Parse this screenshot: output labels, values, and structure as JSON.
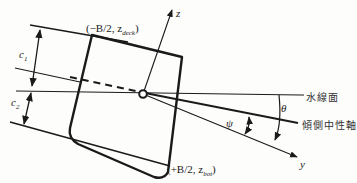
{
  "diagram": {
    "labels": {
      "deck_point": "(−B/2, z",
      "deck_sub": "deck",
      "deck_close": ")",
      "bot_point": "(+B/2, z",
      "bot_sub": "bot",
      "bot_close": ")",
      "z_axis": "z",
      "y_axis": "y",
      "c1": "c",
      "c1_sub": "1",
      "c2": "c",
      "c2_sub": "2",
      "theta": "θ",
      "psi": "ψ",
      "waterline": "水線面",
      "neutral_axis": "傾側中性軸"
    },
    "colors": {
      "line": "#1a1a1a",
      "background": "#fdfdfc"
    }
  }
}
